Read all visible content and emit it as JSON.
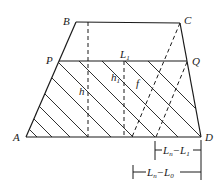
{
  "diagram": {
    "type": "trapezoid-cross-section",
    "colors": {
      "stroke": "#1a1a1a",
      "background": "#ffffff"
    },
    "vertices": {
      "A": {
        "label": "A",
        "x": 26,
        "y": 137
      },
      "B": {
        "label": "B",
        "x": 76,
        "y": 22
      },
      "C": {
        "label": "C",
        "x": 180,
        "y": 23
      },
      "D": {
        "label": "D",
        "x": 201,
        "y": 137
      },
      "P": {
        "label": "P",
        "x": 59,
        "y": 61
      },
      "Q": {
        "label": "Q",
        "x": 187,
        "y": 61
      }
    },
    "labels": {
      "L1": {
        "main": "L",
        "sub": "1"
      },
      "h": "h",
      "h1": {
        "main": "h",
        "sub": "1"
      },
      "f": "f",
      "dim1": {
        "a_main": "L",
        "a_sub": "n",
        "op": "−",
        "b_main": "L",
        "b_sub": "1"
      },
      "dim2": {
        "a_main": "L",
        "a_sub": "n",
        "op": "−",
        "b_main": "L",
        "b_sub": "0"
      }
    }
  }
}
